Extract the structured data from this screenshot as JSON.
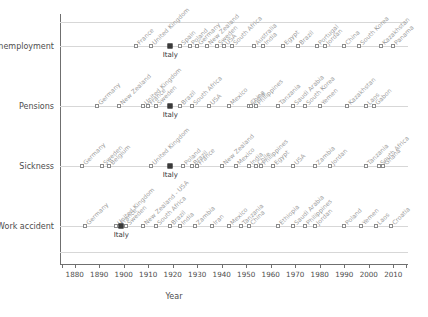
{
  "chart_data": {
    "type": "scatter",
    "title": "",
    "xlabel": "Year",
    "ylabel": "",
    "xlim": [
      1874,
      2016
    ],
    "xticks": [
      1880,
      1890,
      1900,
      1910,
      1920,
      1930,
      1940,
      1950,
      1960,
      1970,
      1980,
      1990,
      2000,
      2010
    ],
    "xtick_labels": [
      "1880",
      "1890",
      "1900",
      "1910",
      "1920",
      "1930",
      "1940",
      "1950",
      "1960",
      "1970",
      "1980",
      "1990",
      "2000",
      "2010"
    ],
    "grid": false,
    "legend": null,
    "highlight_label": "Italy",
    "categories": [
      "Unemployment",
      "Pensions",
      "Sickness",
      "Work accident"
    ],
    "series": [
      {
        "name": "Unemployment",
        "points": [
          {
            "year": 1905,
            "label": "France"
          },
          {
            "year": 1911,
            "label": "United Kingdom"
          },
          {
            "year": 1919,
            "label": "Italy",
            "highlight": true
          },
          {
            "year": 1923,
            "label": "Spain"
          },
          {
            "year": 1927,
            "label": "Poland"
          },
          {
            "year": 1930,
            "label": "Germany"
          },
          {
            "year": 1934,
            "label": "New Zealand"
          },
          {
            "year": 1938,
            "label": "Sweden"
          },
          {
            "year": 1941,
            "label": "USA"
          },
          {
            "year": 1944,
            "label": "South Africa"
          },
          {
            "year": 1953,
            "label": "Australia"
          },
          {
            "year": 1957,
            "label": "India"
          },
          {
            "year": 1965,
            "label": "Egypt"
          },
          {
            "year": 1971,
            "label": "Brazil"
          },
          {
            "year": 1979,
            "label": "Portugal"
          },
          {
            "year": 1982,
            "label": "Jordan"
          },
          {
            "year": 1990,
            "label": "China"
          },
          {
            "year": 1996,
            "label": "South Korea"
          },
          {
            "year": 2005,
            "label": "Kazakhstan"
          },
          {
            "year": 2010,
            "label": "Panama"
          }
        ]
      },
      {
        "name": "Pensions",
        "points": [
          {
            "year": 1889,
            "label": "Germany"
          },
          {
            "year": 1898,
            "label": "New Zealand"
          },
          {
            "year": 1908,
            "label": "United Kingdom"
          },
          {
            "year": 1910,
            "label": "France"
          },
          {
            "year": 1913,
            "label": "Sweden"
          },
          {
            "year": 1919,
            "label": "Italy",
            "highlight": true
          },
          {
            "year": 1923,
            "label": "Brazil"
          },
          {
            "year": 1928,
            "label": "South Africa"
          },
          {
            "year": 1935,
            "label": "USA"
          },
          {
            "year": 1943,
            "label": "Mexico"
          },
          {
            "year": 1951,
            "label": "China"
          },
          {
            "year": 1952,
            "label": "India"
          },
          {
            "year": 1954,
            "label": "Philippines"
          },
          {
            "year": 1963,
            "label": "Tanzania"
          },
          {
            "year": 1969,
            "label": "Saudi Arabia"
          },
          {
            "year": 1974,
            "label": "South Korea"
          },
          {
            "year": 1980,
            "label": "Yemen"
          },
          {
            "year": 1991,
            "label": "Kazakhstan"
          },
          {
            "year": 1999,
            "label": "Laos"
          },
          {
            "year": 2002,
            "label": "Gabon"
          }
        ]
      },
      {
        "name": "Sickness",
        "points": [
          {
            "year": 1883,
            "label": "Germany"
          },
          {
            "year": 1891,
            "label": "Sweden"
          },
          {
            "year": 1894,
            "label": "Belgium"
          },
          {
            "year": 1911,
            "label": "United Kingdom"
          },
          {
            "year": 1919,
            "label": "Italy",
            "highlight": true
          },
          {
            "year": 1924,
            "label": "Poland"
          },
          {
            "year": 1928,
            "label": "Brazil"
          },
          {
            "year": 1930,
            "label": "France"
          },
          {
            "year": 1940,
            "label": "New Zealand"
          },
          {
            "year": 1946,
            "label": "Mexico"
          },
          {
            "year": 1951,
            "label": "India"
          },
          {
            "year": 1954,
            "label": "Chile"
          },
          {
            "year": 1956,
            "label": "Philippines"
          },
          {
            "year": 1961,
            "label": "Egypt"
          },
          {
            "year": 1969,
            "label": "USA"
          },
          {
            "year": 1978,
            "label": "Zambia"
          },
          {
            "year": 1984,
            "label": "Jordan"
          },
          {
            "year": 1999,
            "label": "Tanzania"
          },
          {
            "year": 2004,
            "label": "South Africa"
          },
          {
            "year": 2006,
            "label": "Ghana"
          }
        ]
      },
      {
        "name": "Work accident",
        "points": [
          {
            "year": 1884,
            "label": "Germany"
          },
          {
            "year": 1897,
            "label": "United Kingdom"
          },
          {
            "year": 1898,
            "label": "France"
          },
          {
            "year": 1899,
            "label": "Italy",
            "highlight": true
          },
          {
            "year": 1901,
            "label": "Sweden"
          },
          {
            "year": 1908,
            "label": "New Zealand - USA"
          },
          {
            "year": 1913,
            "label": "South Africa"
          },
          {
            "year": 1919,
            "label": "Brazil"
          },
          {
            "year": 1923,
            "label": "India"
          },
          {
            "year": 1929,
            "label": "Zambia"
          },
          {
            "year": 1936,
            "label": "Iran"
          },
          {
            "year": 1943,
            "label": "Mexico"
          },
          {
            "year": 1948,
            "label": "Tanzania"
          },
          {
            "year": 1951,
            "label": "China"
          },
          {
            "year": 1963,
            "label": "Ethiopia"
          },
          {
            "year": 1969,
            "label": "Saudi Arabia"
          },
          {
            "year": 1974,
            "label": "Philippines"
          },
          {
            "year": 1978,
            "label": "Jordan"
          },
          {
            "year": 1990,
            "label": "Poland"
          },
          {
            "year": 1997,
            "label": "Yemen"
          },
          {
            "year": 2003,
            "label": "Laos"
          },
          {
            "year": 2009,
            "label": "Croatia"
          }
        ]
      }
    ]
  },
  "colors": {
    "marker_edge": "#8c8c8c",
    "marker_face": "#ffffff",
    "highlight": "#3b3b3b",
    "axis": "#6f6f6f",
    "rule": "#d7d7d7",
    "label_text": "#9b9b9b",
    "axis_text": "#4d4d4d"
  }
}
